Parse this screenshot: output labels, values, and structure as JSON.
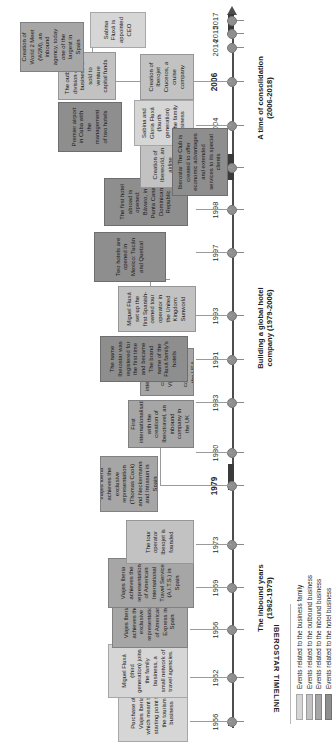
{
  "title": "IBEROSTAR TIMELINE",
  "axis": {
    "years": [
      "1956",
      "1962",
      "1966",
      "1969",
      "1973",
      "1979",
      "1980",
      "1983",
      "1991",
      "1993",
      "1997",
      "1998",
      "2003",
      "2004",
      "2006",
      "2014",
      "2015",
      "2017"
    ]
  },
  "phases": [
    {
      "label": "The inbound years\n(1962-1979)"
    },
    {
      "label": "Building a global hotel\ncompany (1979-2006)"
    },
    {
      "label": "A time of consolidation\n(2006-2018)"
    }
  ],
  "events": [
    {
      "year": "1956",
      "category": "family",
      "text": "Purchase of Viajes Iberia which meant the starting point for the tourism business"
    },
    {
      "year": "1962",
      "category": "family",
      "text": "Miguel Fluxá (third generation) joins the family business, a small network of travel agencies."
    },
    {
      "year": "1966",
      "category": "inbound",
      "text": "Viajes Iberia achieves the exclusive representation of American Express in Spain"
    },
    {
      "year": "1969",
      "category": "inbound",
      "text": "Viajes Iberia achieves the representation of American International Travel Service (A.I.T.S.) in Spain"
    },
    {
      "year": "1973",
      "category": "outbound",
      "text": "The tour operator Iberojet is founded"
    },
    {
      "year": "1979",
      "category": "inbound",
      "text": "Viajes Iberia achieves the exclusive representation (Thomas Cook) and Neckermann and Intrasun in Spain"
    },
    {
      "year": "1980",
      "category": "inbound",
      "text": "First internationalisation with the creation of Iberotravel, an inbound company in the UK"
    },
    {
      "year": "1983",
      "category": "inbound",
      "text": "Second internationalisation with the creation of Visit US, an inbound company in the USA"
    },
    {
      "year": "1991",
      "category": "hotel",
      "text": "The name Iberostar was registered for the first time and became The brand name of the Fluxá family's hotels"
    },
    {
      "year": "1993",
      "category": "outbound",
      "text": "Miguel Fluxá set up the first Spanish-owned tour operator in the United Kingdom: Sunworld"
    },
    {
      "year": "1997",
      "category": "hotel",
      "text": "Two hotels are opened in Mexico: Tucán and Quetzal"
    },
    {
      "year": "1998",
      "category": "hotel",
      "text": "The first hotel abroad is opened: Bávaro, in Punta Cana, Dominican Republic"
    },
    {
      "year": "1998",
      "category": "outbound",
      "text": "Creation of Iberworld, an airline venture"
    },
    {
      "year": "2003",
      "category": "family",
      "text": "Sabina and Gloria Fluxá (fourth generation) join the family business"
    },
    {
      "year": "2004",
      "category": "outbound",
      "text": "Creation of Iberojet Cruceros, a cruise company"
    },
    {
      "year": "2006",
      "category": "hotel",
      "text": "Premier airport in Cuba with the management of two hotels"
    },
    {
      "year": "2006",
      "category": "outbound",
      "text": "The outbound division of the business is sold to venture capital funds"
    },
    {
      "year": "2014",
      "category": "hotel",
      "text": "Iberostar The Club is created to offer economic advantages and extended services to its special clients"
    },
    {
      "year": "2015",
      "category": "inbound",
      "text": "Creation of World 2 Meet (W2M), an inbound agency, today one of the largest in Spain"
    },
    {
      "year": "2017",
      "category": "family",
      "text": "Sabina Fluxá is appointed CEO"
    }
  ],
  "legend": [
    {
      "key": "family",
      "label": "Events related to the business family",
      "color": "#d6d6d6"
    },
    {
      "key": "outbound",
      "label": "Events related to the outbound business",
      "color": "#c2c2c2"
    },
    {
      "key": "inbound",
      "label": "Events related to the inbound business",
      "color": "#a6a6a6"
    },
    {
      "key": "hotel",
      "label": "Events related to the hotel business",
      "color": "#8e8e8e"
    }
  ]
}
